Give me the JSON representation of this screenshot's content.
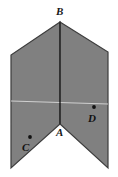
{
  "figure": {
    "background_color": "#ffffff",
    "fill_color": "#808080",
    "edge_color": "#3a3a3a",
    "crease_line_color": "#2b2b2b",
    "fold_line_color": "#c8c8c8",
    "point_marker_color": "#111111",
    "labels": {
      "b": "B",
      "a": "A",
      "c": "C",
      "d": "D"
    },
    "vertices": {
      "b_apex": "60,22",
      "a_notch": "60,124",
      "top_left": "11,55",
      "top_right": "108,52",
      "bottom_left": "11,168",
      "bottom_right": "108,168"
    },
    "points": {
      "c": "30,138",
      "d": "94,108"
    },
    "lines": {
      "crease": "B to A vertical",
      "fold": "horizontal light line across middle"
    }
  }
}
